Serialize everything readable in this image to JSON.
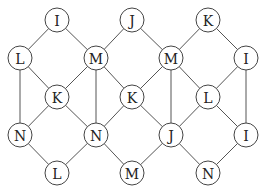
{
  "diagram": {
    "type": "lattice-graph",
    "node_radius": 12,
    "nodes": [
      {
        "id": "n1",
        "label": "I",
        "x": 57,
        "y": 20
      },
      {
        "id": "n2",
        "label": "J",
        "x": 132,
        "y": 20
      },
      {
        "id": "n3",
        "label": "K",
        "x": 208,
        "y": 20
      },
      {
        "id": "n4",
        "label": "L",
        "x": 20,
        "y": 58
      },
      {
        "id": "n5",
        "label": "M",
        "x": 96,
        "y": 58
      },
      {
        "id": "n6",
        "label": "M",
        "x": 171,
        "y": 58
      },
      {
        "id": "n7",
        "label": "I",
        "x": 246,
        "y": 58
      },
      {
        "id": "n8",
        "label": "K",
        "x": 57,
        "y": 97
      },
      {
        "id": "n9",
        "label": "K",
        "x": 132,
        "y": 97
      },
      {
        "id": "n10",
        "label": "L",
        "x": 208,
        "y": 97
      },
      {
        "id": "n11",
        "label": "N",
        "x": 20,
        "y": 135
      },
      {
        "id": "n12",
        "label": "N",
        "x": 96,
        "y": 135
      },
      {
        "id": "n13",
        "label": "J",
        "x": 171,
        "y": 135
      },
      {
        "id": "n14",
        "label": "I",
        "x": 246,
        "y": 135
      },
      {
        "id": "n15",
        "label": "L",
        "x": 57,
        "y": 173
      },
      {
        "id": "n16",
        "label": "M",
        "x": 132,
        "y": 173
      },
      {
        "id": "n17",
        "label": "N",
        "x": 208,
        "y": 173
      }
    ],
    "edges": [
      [
        "n1",
        "n4"
      ],
      [
        "n1",
        "n5"
      ],
      [
        "n2",
        "n5"
      ],
      [
        "n2",
        "n6"
      ],
      [
        "n3",
        "n6"
      ],
      [
        "n3",
        "n7"
      ],
      [
        "n4",
        "n11"
      ],
      [
        "n4",
        "n8"
      ],
      [
        "n5",
        "n8"
      ],
      [
        "n5",
        "n9"
      ],
      [
        "n5",
        "n12"
      ],
      [
        "n6",
        "n9"
      ],
      [
        "n6",
        "n10"
      ],
      [
        "n6",
        "n13"
      ],
      [
        "n7",
        "n10"
      ],
      [
        "n7",
        "n14"
      ],
      [
        "n8",
        "n11"
      ],
      [
        "n8",
        "n12"
      ],
      [
        "n9",
        "n12"
      ],
      [
        "n9",
        "n13"
      ],
      [
        "n10",
        "n13"
      ],
      [
        "n10",
        "n14"
      ],
      [
        "n11",
        "n15"
      ],
      [
        "n12",
        "n15"
      ],
      [
        "n12",
        "n16"
      ],
      [
        "n13",
        "n16"
      ],
      [
        "n13",
        "n17"
      ],
      [
        "n14",
        "n17"
      ]
    ]
  }
}
